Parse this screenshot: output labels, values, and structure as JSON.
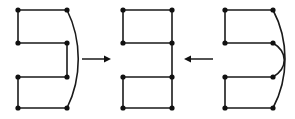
{
  "figure": {
    "background_color": "#ffffff",
    "stroke_color": "#1a1a1a",
    "vertex_color": "#111111",
    "vertex_radius": 2.6,
    "edge_width": 1.6,
    "width": 295,
    "height": 119
  },
  "graphs": [
    {
      "id": "graph-left",
      "label": "left-graph",
      "vertex_count": 8,
      "vertices": [
        {
          "name": "v1",
          "x": 18,
          "y": 10
        },
        {
          "name": "v2",
          "x": 67,
          "y": 10
        },
        {
          "name": "v3",
          "x": 18,
          "y": 43
        },
        {
          "name": "v4",
          "x": 67,
          "y": 43
        },
        {
          "name": "v5",
          "x": 18,
          "y": 77
        },
        {
          "name": "v6",
          "x": 67,
          "y": 77
        },
        {
          "name": "v7",
          "x": 18,
          "y": 108
        },
        {
          "name": "v8",
          "x": 67,
          "y": 108
        }
      ],
      "edges": [
        {
          "name": "top-edge",
          "type": "line",
          "path": "M 18 10 L 67 10"
        },
        {
          "name": "upper-left-edge",
          "type": "line",
          "path": "M 18 10 L 18 43"
        },
        {
          "name": "upper-mid-edge",
          "type": "line",
          "path": "M 18 43 L 67 43"
        },
        {
          "name": "mid-right-edge",
          "type": "line",
          "path": "M 67 43 L 67 77"
        },
        {
          "name": "lower-mid-edge",
          "type": "line",
          "path": "M 18 77 L 67 77"
        },
        {
          "name": "lower-left-edge",
          "type": "line",
          "path": "M 18 77 L 18 108"
        },
        {
          "name": "bottom-edge",
          "type": "line",
          "path": "M 18 108 L 67 108"
        },
        {
          "name": "outer-arc-edge",
          "type": "curve",
          "path": "M 67 10 C 82 40, 82 78, 67 108"
        }
      ]
    },
    {
      "id": "graph-middle",
      "label": "middle-graph",
      "vertex_count": 8,
      "vertices": [
        {
          "name": "v1",
          "x": 123,
          "y": 10
        },
        {
          "name": "v2",
          "x": 172,
          "y": 10
        },
        {
          "name": "v3",
          "x": 123,
          "y": 43
        },
        {
          "name": "v4",
          "x": 172,
          "y": 43
        },
        {
          "name": "v5",
          "x": 123,
          "y": 77
        },
        {
          "name": "v6",
          "x": 172,
          "y": 77
        },
        {
          "name": "v7",
          "x": 123,
          "y": 108
        },
        {
          "name": "v8",
          "x": 172,
          "y": 108
        }
      ],
      "edges": [
        {
          "name": "top-edge",
          "type": "line",
          "path": "M 123 10 L 172 10"
        },
        {
          "name": "upper-left-edge",
          "type": "line",
          "path": "M 123 10 L 123 43"
        },
        {
          "name": "upper-right-edge",
          "type": "line",
          "path": "M 172 10 L 172 43"
        },
        {
          "name": "upper-mid-edge",
          "type": "line",
          "path": "M 123 43 L 172 43"
        },
        {
          "name": "mid-right-edge",
          "type": "line",
          "path": "M 172 43 L 172 77"
        },
        {
          "name": "lower-mid-edge",
          "type": "line",
          "path": "M 123 77 L 172 77"
        },
        {
          "name": "lower-left-edge",
          "type": "line",
          "path": "M 123 77 L 123 108"
        },
        {
          "name": "lower-right-edge",
          "type": "line",
          "path": "M 172 77 L 172 108"
        },
        {
          "name": "bottom-edge",
          "type": "line",
          "path": "M 123 108 L 172 108"
        }
      ]
    },
    {
      "id": "graph-right",
      "label": "right-graph",
      "vertex_count": 8,
      "vertices": [
        {
          "name": "v1",
          "x": 225,
          "y": 10
        },
        {
          "name": "v2",
          "x": 273,
          "y": 10
        },
        {
          "name": "v3",
          "x": 225,
          "y": 43
        },
        {
          "name": "v4",
          "x": 273,
          "y": 43
        },
        {
          "name": "v5",
          "x": 225,
          "y": 77
        },
        {
          "name": "v6",
          "x": 273,
          "y": 77
        },
        {
          "name": "v7",
          "x": 225,
          "y": 108
        },
        {
          "name": "v8",
          "x": 273,
          "y": 108
        }
      ],
      "edges": [
        {
          "name": "top-edge",
          "type": "line",
          "path": "M 225 10 L 273 10"
        },
        {
          "name": "upper-left-edge",
          "type": "line",
          "path": "M 225 10 L 225 43"
        },
        {
          "name": "upper-mid-edge",
          "type": "line",
          "path": "M 225 43 L 273 43"
        },
        {
          "name": "lower-mid-edge",
          "type": "line",
          "path": "M 225 77 L 273 77"
        },
        {
          "name": "lower-left-edge",
          "type": "line",
          "path": "M 225 77 L 225 108"
        },
        {
          "name": "bottom-edge",
          "type": "line",
          "path": "M 225 108 L 273 108"
        },
        {
          "name": "inner-arc-edge",
          "type": "curve",
          "path": "M 273 43 C 288 52, 288 68, 273 77"
        },
        {
          "name": "outer-arc-edge",
          "type": "curve",
          "path": "M 273 10 C 289 40, 289 78, 273 108"
        }
      ]
    }
  ],
  "arrows": [
    {
      "id": "arrow-left-to-middle",
      "label": "arrow-right",
      "direction": "right",
      "line": {
        "x1": 82,
        "y1": 59,
        "x2": 108,
        "y2": 59
      },
      "head": "111,59 104,55.5 104,62.5"
    },
    {
      "id": "arrow-right-to-middle",
      "label": "arrow-left",
      "direction": "left",
      "line": {
        "x1": 213,
        "y1": 59,
        "x2": 187,
        "y2": 59
      },
      "head": "184,59 191,55.5 191,62.5"
    }
  ]
}
